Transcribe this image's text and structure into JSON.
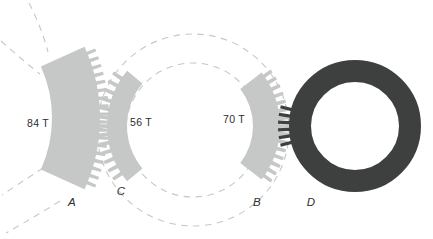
{
  "figure": {
    "gears": {
      "A": {
        "teeth_label": "84 T",
        "name_label": "A"
      },
      "C": {
        "teeth_label": "56 T",
        "name_label": "C"
      },
      "B": {
        "teeth_label": "70 T",
        "name_label": "B"
      },
      "D": {
        "name_label": "D"
      }
    },
    "colors": {
      "gear_body": "#c6c8c7",
      "ring_gear": "#3e403f",
      "dashed_line": "#c7c7c7",
      "text": "#2d2d2d"
    }
  }
}
